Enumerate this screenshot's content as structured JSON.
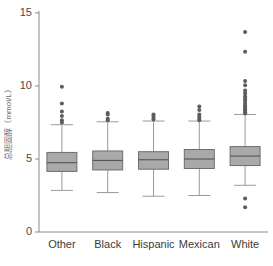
{
  "chart_data": {
    "type": "box",
    "title": "",
    "xlabel": "",
    "ylabel": "总胆固醇（mmol/L）",
    "ylim": [
      0,
      15
    ],
    "yticks": [
      0,
      5,
      10,
      15
    ],
    "ytick_labels": [
      "0",
      "5",
      "10",
      "15"
    ],
    "grid": false,
    "legend": "none",
    "categories": [
      "Other",
      "Black",
      "Hispanic",
      "Mexican",
      "White"
    ],
    "colors": {
      "box_fill": "#a9a9a9",
      "box_edge": "#6e6e6e",
      "median": "#5a5a5a",
      "whisker": "#9a9a9a",
      "outlier": "#5c5c5c",
      "axis": "#8a8a8a",
      "background": "#ffffff"
    },
    "boxes": [
      {
        "label": "Other",
        "whisker_low": 2.85,
        "q1": 4.15,
        "median": 4.75,
        "q3": 5.45,
        "whisker_high": 7.35,
        "outliers": [
          9.95,
          8.8,
          8.25,
          7.95,
          7.65,
          7.5
        ]
      },
      {
        "label": "Black",
        "whisker_low": 2.7,
        "q1": 4.25,
        "median": 4.9,
        "q3": 5.55,
        "whisker_high": 7.55,
        "outliers": [
          8.15,
          8.05,
          7.75,
          7.65
        ]
      },
      {
        "label": "Hispanic",
        "whisker_low": 2.45,
        "q1": 4.3,
        "median": 4.95,
        "q3": 5.5,
        "whisker_high": 7.6,
        "outliers": [
          8.05,
          7.95,
          7.8,
          7.7
        ]
      },
      {
        "label": "Mexican",
        "whisker_low": 2.5,
        "q1": 4.35,
        "median": 5.0,
        "q3": 5.65,
        "whisker_high": 7.6,
        "outliers": [
          8.6,
          8.35,
          8.05,
          7.9,
          7.75,
          7.65
        ]
      },
      {
        "label": "White",
        "whisker_low": 3.2,
        "q1": 4.55,
        "median": 5.2,
        "q3": 5.85,
        "whisker_high": 8.05,
        "outliers": [
          13.7,
          12.35,
          10.35,
          10.05,
          9.7,
          9.5,
          9.3,
          9.15,
          9.0,
          8.85,
          8.7,
          8.6,
          8.5,
          8.4,
          8.3,
          8.2,
          8.12,
          2.3,
          1.7
        ]
      }
    ]
  }
}
